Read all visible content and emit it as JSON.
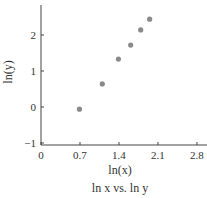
{
  "chart_data": {
    "type": "scatter",
    "title": "ln x vs. ln y",
    "xlabel": "ln(x)",
    "ylabel": "ln(y)",
    "xlim": [
      0,
      2.8
    ],
    "ylim": [
      -1,
      2.6
    ],
    "xticks": [
      "0",
      "0.7",
      "1.4",
      "2.1",
      "2.8"
    ],
    "yticks": [
      "−1",
      "0",
      "1",
      "2"
    ],
    "grid": false,
    "legend": null,
    "series": [
      {
        "name": "ln x vs. ln y",
        "color": "#8a8a8a",
        "points": [
          {
            "x": 0.69,
            "y": -0.06
          },
          {
            "x": 1.1,
            "y": 0.64
          },
          {
            "x": 1.39,
            "y": 1.33
          },
          {
            "x": 1.61,
            "y": 1.72
          },
          {
            "x": 1.79,
            "y": 2.14
          },
          {
            "x": 1.95,
            "y": 2.44
          }
        ]
      }
    ]
  }
}
